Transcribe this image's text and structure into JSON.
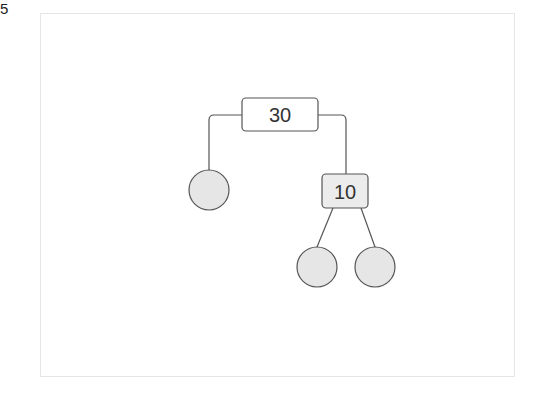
{
  "figure": {
    "label": "5"
  },
  "tree": {
    "root": {
      "label": "30",
      "shape": "rounded-rect",
      "fill": "#ffffff"
    },
    "left_child": {
      "label": "",
      "shape": "circle",
      "fill": "#e6e6e6"
    },
    "right_child": {
      "label": "10",
      "shape": "rounded-rect",
      "fill": "#ececec",
      "children": [
        {
          "label": "",
          "shape": "circle",
          "fill": "#e6e6e6"
        },
        {
          "label": "",
          "shape": "circle",
          "fill": "#e6e6e6"
        }
      ]
    }
  },
  "colors": {
    "stroke": "#555555",
    "circle_fill": "#e6e6e6",
    "frame": "#e6e6e6"
  }
}
